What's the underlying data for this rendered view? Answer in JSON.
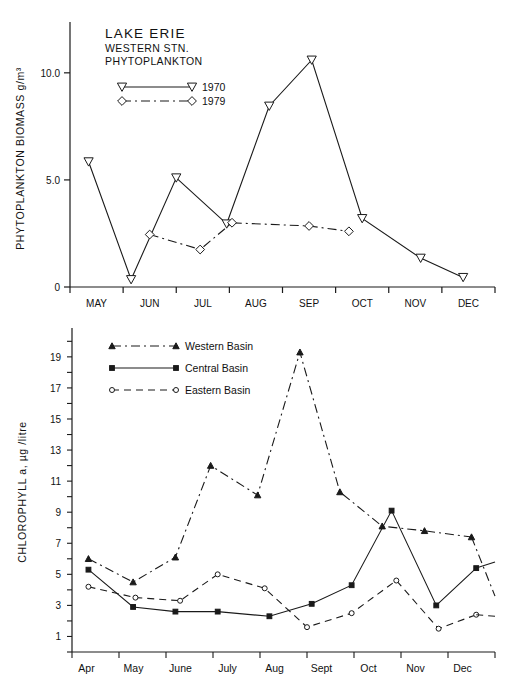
{
  "figures": [
    {
      "id": "phytoplankton-biomass",
      "title_lines": [
        "LAKE  ERIE",
        "WESTERN  STN.",
        "PHYTOPLANKTON"
      ],
      "legend": [
        {
          "label": "1970",
          "marker": "triangle-down-open",
          "style": "solid"
        },
        {
          "label": "1979",
          "marker": "diamond-open",
          "style": "dash-dot"
        }
      ]
    },
    {
      "id": "chlorophyll-a",
      "legend": [
        {
          "label": "Western Basin",
          "marker": "triangle-solid",
          "style": "dash-dot"
        },
        {
          "label": "Central Basin",
          "marker": "square-solid",
          "style": "solid"
        },
        {
          "label": "Eastern Basin",
          "marker": "circle-open",
          "style": "dashed"
        }
      ]
    }
  ],
  "chart_data": [
    {
      "type": "line",
      "title": "LAKE ERIE WESTERN STN. PHYTOPLANKTON",
      "xlabel": "",
      "ylabel": "PHYTOPLANKTON BIOMASS   g/m³",
      "ylim": [
        0,
        12.0
      ],
      "yticks": [
        0,
        5.0,
        10.0
      ],
      "yticklabels": [
        "0",
        "5.0",
        "10.0"
      ],
      "grid": false,
      "legend_position": "upper-left",
      "categories": [
        "MAY",
        "JUN",
        "JUL",
        "AUG",
        "SEP",
        "OCT",
        "NOV",
        "DEC"
      ],
      "x": [
        0.5,
        1.5,
        2.5,
        3.5,
        4.5,
        5.5,
        6.5,
        7.5
      ],
      "series": [
        {
          "name": "1970",
          "marker": "triangle-down-open",
          "style": "solid",
          "x": [
            0.35,
            1.15,
            2.0,
            2.95,
            3.75,
            4.55,
            5.5,
            6.6,
            7.4
          ],
          "values": [
            5.85,
            0.35,
            5.1,
            2.95,
            8.45,
            10.6,
            3.2,
            1.35,
            0.45
          ]
        },
        {
          "name": "1979",
          "marker": "diamond-open",
          "style": "dash-dot",
          "x": [
            1.5,
            2.45,
            3.05,
            4.5,
            5.25
          ],
          "values": [
            2.45,
            1.75,
            3.0,
            2.85,
            2.6
          ]
        }
      ]
    },
    {
      "type": "line",
      "title": "",
      "xlabel": "",
      "ylabel": "CHLOROPHYLL a, µg /litre",
      "ylim": [
        0,
        20.5
      ],
      "yticks": [
        1,
        3,
        5,
        7,
        9,
        11,
        13,
        15,
        17,
        19
      ],
      "yticklabels": [
        "1",
        "3",
        "5",
        "7",
        "9",
        "11",
        "13",
        "15",
        "17",
        "19"
      ],
      "grid": false,
      "legend_position": "upper-left",
      "categories": [
        "Apr",
        "May",
        "June",
        "July",
        "Aug",
        "Sept",
        "Oct",
        "Nov",
        "Dec"
      ],
      "x": [
        0.5,
        1.5,
        2.5,
        3.5,
        4.5,
        5.5,
        6.5,
        7.5,
        8.5
      ],
      "series": [
        {
          "name": "Western Basin",
          "marker": "triangle-solid",
          "style": "dash-dot",
          "x": [
            0.35,
            1.3,
            2.2,
            2.95,
            3.95,
            4.85,
            5.7,
            6.6,
            7.5,
            8.5
          ],
          "values": [
            6.0,
            4.5,
            6.1,
            12.0,
            10.1,
            19.3,
            10.3,
            8.1,
            7.8,
            7.4
          ]
        },
        {
          "name": "Central Basin",
          "marker": "square-solid",
          "style": "solid",
          "x": [
            0.35,
            1.3,
            2.2,
            3.1,
            4.2,
            5.1,
            5.95,
            6.8,
            7.75,
            8.6
          ],
          "values": [
            5.3,
            2.9,
            2.6,
            2.6,
            2.3,
            3.1,
            4.3,
            9.1,
            3.0,
            5.4
          ]
        },
        {
          "name": "Eastern Basin",
          "marker": "circle-open",
          "style": "dashed",
          "x": [
            0.35,
            1.35,
            2.3,
            3.1,
            4.1,
            5.0,
            5.95,
            6.9,
            7.8,
            8.6
          ],
          "values": [
            4.2,
            3.5,
            3.3,
            5.0,
            4.1,
            1.6,
            2.5,
            4.6,
            1.5,
            2.4
          ]
        }
      ],
      "extra_segments": [
        {
          "name": "Western Basin tail",
          "style": "dash-dot",
          "x": [
            8.5,
            9.0
          ],
          "values": [
            7.4,
            3.6
          ]
        },
        {
          "name": "Central Basin tail",
          "style": "solid",
          "x": [
            8.6,
            9.0
          ],
          "values": [
            5.4,
            5.8
          ]
        },
        {
          "name": "Eastern Basin tail",
          "style": "dashed",
          "x": [
            8.6,
            9.0
          ],
          "values": [
            2.4,
            2.3
          ]
        }
      ]
    }
  ]
}
